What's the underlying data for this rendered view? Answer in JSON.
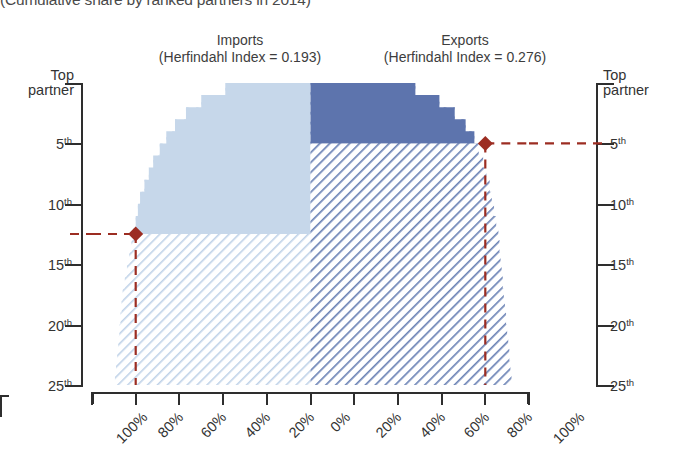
{
  "title": "(Cumulative share by ranked partners in 2014)",
  "panels": {
    "imports": {
      "name": "Imports",
      "index_label": "(Herfindahl Index = 0.193)",
      "herfindahl_index": 0.193,
      "fill_solid": "#c6d7ea",
      "fill_hatch": "#dce7f3"
    },
    "exports": {
      "name": "Exports",
      "index_label": "(Herfindahl Index = 0.276)",
      "herfindahl_index": 0.276,
      "fill_solid": "#5d74ad",
      "fill_hatch": "#8fa2c8"
    }
  },
  "axes": {
    "y_left_top": "Top\npartner",
    "y_left_top_line1": "Top",
    "y_left_top_line2": "partner",
    "y_right_top_line1": "Top",
    "y_right_top_line2": "partner",
    "y_ticks": [
      {
        "value": 5,
        "num": "5",
        "ord": "th"
      },
      {
        "value": 10,
        "num": "10",
        "ord": "th"
      },
      {
        "value": 15,
        "num": "15",
        "ord": "th"
      },
      {
        "value": 20,
        "num": "20",
        "ord": "th"
      },
      {
        "value": 25,
        "num": "25",
        "ord": "th"
      }
    ],
    "x_left_ticks": [
      "100%",
      "80%",
      "60%",
      "40%",
      "20%",
      "0%"
    ],
    "x_right_ticks": [
      "20%",
      "40%",
      "60%",
      "80%",
      "100%"
    ],
    "x_center_tick": "0%"
  },
  "markers": {
    "imports": {
      "rank": 12.5,
      "share": "80%",
      "color": "#9c2d22"
    },
    "exports": {
      "rank": 5,
      "share": "80%",
      "color": "#9c2d22"
    }
  },
  "chart_data": {
    "type": "area",
    "title": "(Cumulative share by ranked partners in 2014)",
    "xlabel": "",
    "ylabel": "Ranked partner",
    "ylim": [
      1,
      25
    ],
    "xlim": [
      0,
      100
    ],
    "grid": false,
    "legend": "none",
    "orientation": "mirrored-horizontal",
    "note": "Left panel (Imports) extends leftward from center 0%; right panel (Exports) extends rightward from center 0%. Y axis is partner rank 1 (top) through 25 (bottom). Values are cumulative share of trade held by the top-N partners.",
    "categories": [
      1,
      2,
      3,
      4,
      5,
      6,
      7,
      8,
      9,
      10,
      11,
      12,
      13,
      14,
      15,
      16,
      17,
      18,
      19,
      20,
      21,
      22,
      23,
      24,
      25
    ],
    "series": [
      {
        "name": "Imports",
        "herfindahl_index": 0.193,
        "side": "left",
        "solid_above_rank": 12.5,
        "values": [
          39,
          50,
          57,
          62,
          66,
          69,
          72,
          74,
          76,
          78,
          79,
          80,
          81,
          82,
          83,
          84,
          85,
          86,
          86.5,
          87,
          87.5,
          88,
          88.5,
          89,
          89.5
        ]
      },
      {
        "name": "Exports",
        "herfindahl_index": 0.276,
        "side": "right",
        "solid_above_rank": 5,
        "values": [
          48,
          59,
          66,
          71,
          75,
          77,
          79,
          80.5,
          82,
          83,
          84,
          85,
          86,
          86.5,
          87,
          87.5,
          88,
          88.5,
          89,
          89.5,
          90,
          90.5,
          91,
          91.5,
          92
        ]
      }
    ],
    "annotations": [
      {
        "label": "Imports top-12 share",
        "rank": 12.5,
        "value": "80%",
        "marker": "diamond",
        "color": "#9c2d22"
      },
      {
        "label": "Exports top-5 share",
        "rank": 5,
        "value": "80%",
        "marker": "diamond",
        "color": "#9c2d22"
      }
    ]
  }
}
